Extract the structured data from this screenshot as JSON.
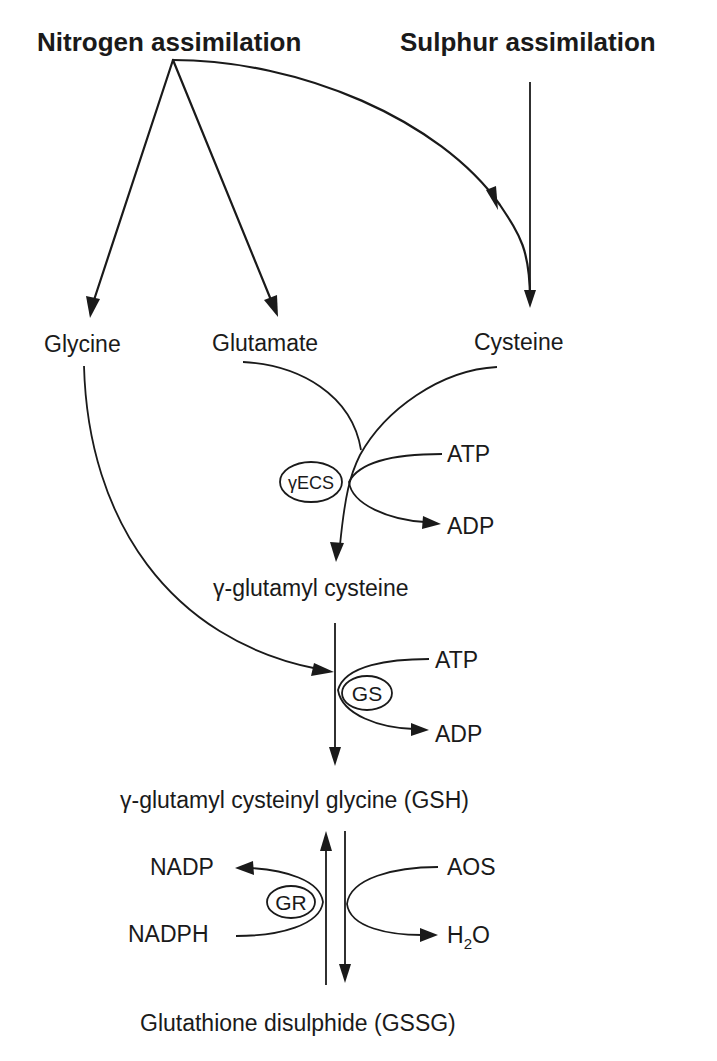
{
  "diagram": {
    "sources": {
      "nitrogen": "Nitrogen assimilation",
      "sulphur": "Sulphur assimilation"
    },
    "precursors": {
      "glycine": "Glycine",
      "glutamate": "Glutamate",
      "cysteine": "Cysteine"
    },
    "step1": {
      "enzyme": "γECS",
      "cofactor_in": "ATP",
      "cofactor_out": "ADP",
      "product": "γ-glutamyl cysteine"
    },
    "step2": {
      "enzyme": "GS",
      "cofactor_in": "ATP",
      "cofactor_out": "ADP",
      "product": "γ-glutamyl cysteinyl glycine (GSH)"
    },
    "redox": {
      "enzyme": "GR",
      "reductant_in": "NADPH",
      "reductant_out": "NADP",
      "oxidant_in": "AOS",
      "oxidant_out_main": "H",
      "oxidant_out_sub": "2",
      "oxidant_out_tail": "O",
      "product": "Glutathione disulphide (GSSG)"
    }
  }
}
